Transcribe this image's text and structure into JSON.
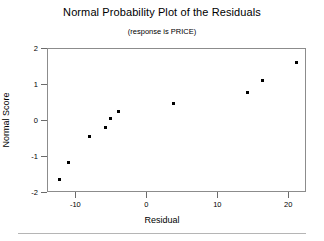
{
  "chart_data": {
    "type": "scatter",
    "title": "Normal Probability Plot of the Residuals",
    "subtitle": "(response is PRICE)",
    "xlabel": "Residual",
    "ylabel": "Normal Score",
    "xlim": [
      -14.0,
      22.5
    ],
    "ylim": [
      -2.0,
      2.0
    ],
    "xticks": [
      -10,
      0,
      10,
      20
    ],
    "xtick_labels": [
      "-10",
      "0",
      "10",
      "20"
    ],
    "yticks": [
      2,
      1,
      0,
      -1,
      -2
    ],
    "ytick_labels": [
      "2",
      "1",
      "0",
      "-1",
      "-2"
    ],
    "grid": false,
    "legend": null,
    "marker": "square",
    "marker_color": "#000000",
    "frame_color": "#8c8c8c",
    "background": "#ffffff",
    "points": [
      {
        "x": -12.3,
        "y": -1.66
      },
      {
        "x": -11.0,
        "y": -1.17
      },
      {
        "x": -8.0,
        "y": -0.46
      },
      {
        "x": -5.8,
        "y": -0.2
      },
      {
        "x": -5.1,
        "y": 0.03
      },
      {
        "x": -3.9,
        "y": 0.23
      },
      {
        "x": 3.8,
        "y": 0.46
      },
      {
        "x": 14.2,
        "y": 0.77
      },
      {
        "x": 16.3,
        "y": 1.09
      },
      {
        "x": 21.1,
        "y": 1.6
      }
    ]
  }
}
